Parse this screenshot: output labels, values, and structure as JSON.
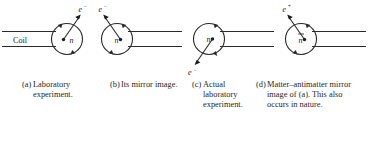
{
  "figure": {
    "background_color": "#ffffff",
    "stroke_color": "#2a2a2a",
    "panel_count": 4
  },
  "panels": [
    {
      "id": "a",
      "coil_label": "Coil",
      "nucleus_label": "n",
      "nucleus_bar": false,
      "particle_symbol": "e",
      "particle_charge": "−",
      "particle_direction": "up-right",
      "coil_side": "left",
      "spin_sense": "counterclockwise"
    },
    {
      "id": "b",
      "coil_label": "",
      "nucleus_label": "n",
      "nucleus_bar": false,
      "particle_symbol": "e",
      "particle_charge": "−",
      "particle_direction": "up-left",
      "coil_side": "right",
      "spin_sense": "clockwise"
    },
    {
      "id": "c",
      "coil_label": "",
      "nucleus_label": "n",
      "nucleus_bar": false,
      "particle_symbol": "e",
      "particle_charge": "−",
      "particle_direction": "down-left",
      "coil_side": "right",
      "spin_sense": "clockwise"
    },
    {
      "id": "d",
      "coil_label": "",
      "nucleus_label": "n",
      "nucleus_bar": true,
      "particle_symbol": "e",
      "particle_charge": "+",
      "particle_direction": "up-left",
      "coil_side": "right",
      "spin_sense": "clockwise"
    }
  ],
  "captions": [
    {
      "tag": "(a)",
      "text": "Laboratory experiment."
    },
    {
      "tag": "(b)",
      "text": "Its mirror image."
    },
    {
      "tag": "(c)",
      "text": "Actual laboratory experiment."
    },
    {
      "tag": "(d)",
      "text": "Matter–antimatter mirror image of (a). This also occurs in nature."
    }
  ]
}
